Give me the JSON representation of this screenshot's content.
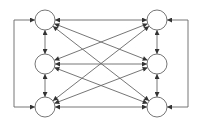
{
  "diagram": {
    "type": "bipartite-network",
    "colors": {
      "stroke": "#666666",
      "node_fill": "#ffffff",
      "arrow": "#333333"
    },
    "nodes": [
      {
        "id": "L1",
        "x": 45,
        "y": 20,
        "r": 10
      },
      {
        "id": "L2",
        "x": 45,
        "y": 64,
        "r": 10
      },
      {
        "id": "L3",
        "x": 45,
        "y": 107,
        "r": 10
      },
      {
        "id": "R1",
        "x": 157,
        "y": 20,
        "r": 10
      },
      {
        "id": "R2",
        "x": 157,
        "y": 64,
        "r": 10
      },
      {
        "id": "R3",
        "x": 157,
        "y": 107,
        "r": 10
      }
    ],
    "edges_bidirectional": [
      [
        "L1",
        "R1"
      ],
      [
        "L1",
        "R2"
      ],
      [
        "L1",
        "R3"
      ],
      [
        "L2",
        "R1"
      ],
      [
        "L2",
        "R2"
      ],
      [
        "L2",
        "R3"
      ],
      [
        "L3",
        "R1"
      ],
      [
        "L3",
        "R2"
      ],
      [
        "L3",
        "R3"
      ],
      [
        "L1",
        "L2"
      ],
      [
        "L2",
        "L3"
      ],
      [
        "R1",
        "R2"
      ],
      [
        "R2",
        "R3"
      ]
    ],
    "loops": [
      {
        "side": "left",
        "x": 14,
        "from": "L1",
        "to": "L3"
      },
      {
        "side": "right",
        "x": 188,
        "from": "R1",
        "to": "R3"
      }
    ]
  }
}
